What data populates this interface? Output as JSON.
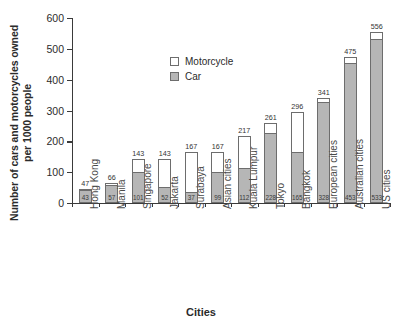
{
  "chart_data": {
    "type": "bar",
    "subtype": "stacked-bar",
    "title": "",
    "xlabel": "Cities",
    "ylabel": "Number of cars and motorcycles owned per 1000 people",
    "ylim": [
      0,
      600
    ],
    "yticks": [
      0,
      100,
      200,
      300,
      400,
      500,
      600
    ],
    "grid": false,
    "legend_position": "upper-left-inside",
    "categories": [
      "Hong Kong",
      "Manila",
      "Singapore",
      "Jakarta",
      "Surabaya",
      "Asian cities",
      "Kuala Lumpur",
      "Tokyo",
      "Bangkok",
      "European cities",
      "Australian cities",
      "US cities"
    ],
    "series": [
      {
        "name": "Car",
        "color": "#b6b6b6",
        "values": [
          43,
          57,
          101,
          52,
          37,
          99,
          112,
          228,
          165,
          328,
          453,
          533
        ]
      },
      {
        "name": "Motorcycle",
        "color": "#ffffff",
        "values": [
          4,
          9,
          42,
          91,
          130,
          68,
          105,
          33,
          131,
          13,
          22,
          23
        ]
      }
    ],
    "totals": [
      47,
      66,
      143,
      143,
      167,
      167,
      217,
      261,
      296,
      341,
      475,
      556
    ],
    "total_labels": [
      "47",
      "66",
      "143",
      "143",
      "167",
      "167",
      "217",
      "261",
      "296",
      "341",
      "475",
      "556"
    ],
    "car_labels": [
      "43",
      "57",
      "101",
      "52",
      "37",
      "99",
      "112",
      "228",
      "165",
      "328",
      "453",
      "533"
    ]
  },
  "legend": {
    "entries": [
      {
        "label": "Motorcycle",
        "swatch": "white-square-outline"
      },
      {
        "label": "Car",
        "swatch": "gray-square-outline"
      }
    ]
  },
  "axes": {
    "y_tick_labels": [
      "600",
      "500",
      "400",
      "300",
      "200",
      "100",
      "0"
    ],
    "y_title": "Number of cars and motorcycles owned per 1000 people",
    "x_title": "Cities"
  }
}
